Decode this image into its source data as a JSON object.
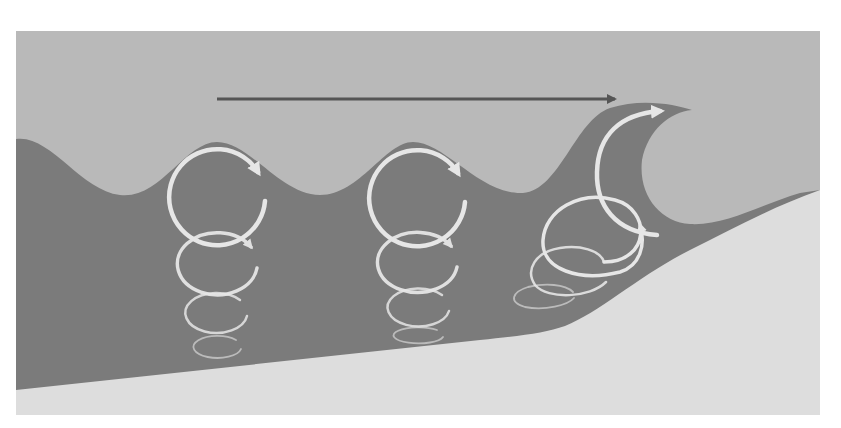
{
  "diagram": {
    "colors": {
      "background": "#ffffff",
      "sky": "#b9b9b9",
      "water": "#7b7b7b",
      "sand": "#dddddd",
      "orbit": "#e6e6e6",
      "direction_arrow": "#555555"
    },
    "frame": {
      "x": 16,
      "y": 31,
      "width": 804,
      "height": 384
    },
    "direction_arrow": {
      "x1": 217,
      "x2": 617,
      "y": 99,
      "icon": "arrow-right-icon"
    },
    "orbit_columns": [
      {
        "name": "deep-water-orbits",
        "orbits": [
          {
            "cx": 217,
            "cy": 197,
            "rx": 48,
            "ry": 48,
            "opacity": 1.0,
            "width": 4.5
          },
          {
            "cx": 217,
            "cy": 263,
            "rx": 40,
            "ry": 31,
            "opacity": 0.95,
            "width": 3.5
          },
          {
            "cx": 216,
            "cy": 312,
            "rx": 31,
            "ry": 20,
            "opacity": 0.85,
            "width": 2.5
          },
          {
            "cx": 217,
            "cy": 347,
            "rx": 24,
            "ry": 11,
            "opacity": 0.6,
            "width": 1.8
          }
        ]
      },
      {
        "name": "middle-orbits",
        "orbits": [
          {
            "cx": 417,
            "cy": 198,
            "rx": 48,
            "ry": 48,
            "opacity": 1.0,
            "width": 4.5
          },
          {
            "cx": 417,
            "cy": 262,
            "rx": 40,
            "ry": 30,
            "opacity": 0.95,
            "width": 3.5
          },
          {
            "cx": 418,
            "cy": 307,
            "rx": 31,
            "ry": 19,
            "opacity": 0.85,
            "width": 2.5
          },
          {
            "cx": 418,
            "cy": 335,
            "rx": 25,
            "ry": 8,
            "opacity": 0.6,
            "width": 1.8
          }
        ]
      },
      {
        "name": "shoaling-orbits",
        "orbits": [
          {
            "cx": 594,
            "cy": 237,
            "rx": 51,
            "ry": 40,
            "opacity": 1.0,
            "width": 3.5
          },
          {
            "cx": 569,
            "cy": 272,
            "rx": 39,
            "ry": 25,
            "opacity": 0.9,
            "width": 2.5
          },
          {
            "cx": 543,
            "cy": 296,
            "rx": 31,
            "ry": 12,
            "opacity": 0.6,
            "width": 1.8
          }
        ]
      }
    ],
    "breaking_arc": {
      "description": "Large orbit arc carrying water up into the breaking crest",
      "icon": "arrow-right-icon"
    }
  }
}
